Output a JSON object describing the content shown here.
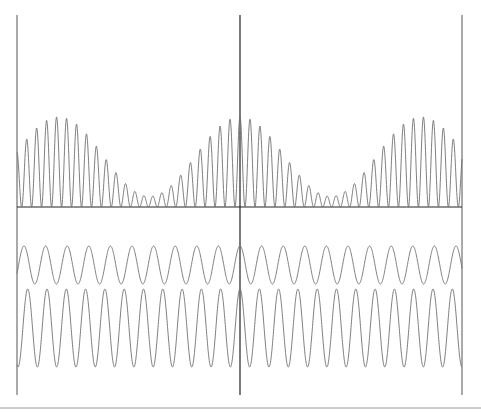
{
  "chart_data": {
    "type": "line",
    "title": "",
    "xlabel": "",
    "ylabel": "",
    "grid": false,
    "legend": null,
    "panels": [
      {
        "name": "beat-intensity",
        "position": "top",
        "baseline_y": 207,
        "formula": "k * (w1 + w2)^2",
        "scale_k": 0.0268,
        "max_height_px": 90,
        "min_envelope_height_px": 10,
        "envelope_maxima_x": [
          55,
          240,
          433
        ],
        "envelope_minima_x": [
          145,
          338
        ]
      },
      {
        "name": "wave-1",
        "position": "bottom-upper",
        "center_y": 265,
        "amplitude_px": 19,
        "period_px": 21.6,
        "phase_zero_x": 240,
        "cycles_visible": 20.6
      },
      {
        "name": "wave-2",
        "position": "bottom-lower",
        "center_y": 328,
        "amplitude_px": 39,
        "period_px": 19.3,
        "phase_zero_x": 240,
        "cycles_visible": 23
      }
    ],
    "x_range_px": [
      17,
      462
    ],
    "center_line_x": 240,
    "vertical_lines_x": [
      17,
      240,
      462
    ],
    "vertical_lines_y": [
      15,
      395
    ],
    "bottom_rule_y": 408,
    "colors": {
      "wave": "#707070",
      "axis": "#555555",
      "center": "#222222",
      "background": "#ffffff"
    }
  },
  "labels": {
    "figure": "Beat pattern: two sine waves and their squared sum"
  }
}
